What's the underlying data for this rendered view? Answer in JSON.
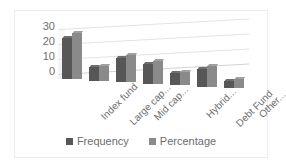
{
  "chart_data": {
    "type": "bar",
    "title": "",
    "xlabel": "",
    "ylabel": "",
    "ylim": [
      0,
      35
    ],
    "yticks": [
      "30",
      "20",
      "10",
      "0"
    ],
    "grid": true,
    "legend_position": "bottom",
    "categories": [
      "Index fund",
      "Large cap...",
      "Mid cap...",
      "",
      "Hybrid...",
      "Debt Fund",
      "Other..."
    ],
    "visible_category_labels": [
      "Index fund",
      "Large cap...",
      "Mid cap...",
      "Hybrid...",
      "Debt Fund",
      "Other..."
    ],
    "series": [
      {
        "name": "Frequency",
        "color": "#575757",
        "values": [
          28,
          9,
          16,
          13,
          8,
          12,
          5
        ]
      },
      {
        "name": "Percentage",
        "color": "#8a8a8a",
        "values": [
          31,
          10,
          18,
          15,
          9,
          14,
          6
        ]
      }
    ]
  },
  "legend": {
    "items": [
      {
        "label": "Frequency"
      },
      {
        "label": "Percentage"
      }
    ]
  },
  "colors": {
    "frequency": "#575757",
    "percentage": "#8a8a8a",
    "gridline": "#e3e3e3",
    "axis_text": "#6d6d6d",
    "border": "#eceded"
  }
}
